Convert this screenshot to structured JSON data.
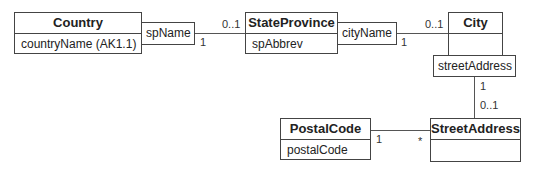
{
  "diagram": {
    "type": "UML class diagram",
    "classes": [
      {
        "id": "country",
        "name": "Country",
        "attributes": [
          "countryName (AK1.1)"
        ]
      },
      {
        "id": "state_province",
        "name": "StateProvince",
        "attributes": [
          "spAbbrev"
        ]
      },
      {
        "id": "city",
        "name": "City",
        "attributes": [
          ""
        ]
      },
      {
        "id": "postal_code",
        "name": "PostalCode",
        "attributes": [
          "postalCode"
        ]
      },
      {
        "id": "street_address",
        "name": "StreetAddress",
        "attributes": [
          ""
        ]
      }
    ],
    "qualifiers": {
      "sp_name": "spName",
      "city_name": "cityName",
      "street_address": "streetAddress"
    },
    "associations": [
      {
        "from": "Country",
        "qualifier": "spName",
        "to": "StateProvince",
        "from_mult": "1",
        "to_mult": "0..1"
      },
      {
        "from": "StateProvince",
        "qualifier": "cityName",
        "to": "City",
        "from_mult": "1",
        "to_mult": "0..1"
      },
      {
        "from": "City",
        "qualifier": "streetAddress",
        "to": "StreetAddress",
        "from_mult": "1",
        "to_mult": "0..1"
      },
      {
        "from": "PostalCode",
        "to": "StreetAddress",
        "from_mult": "1",
        "to_mult": "*"
      }
    ]
  }
}
